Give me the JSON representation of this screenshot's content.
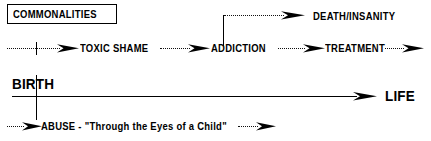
{
  "diagram": {
    "title_box": {
      "label": "COMMONALITIES"
    },
    "timeline": {
      "start_label": "BIRTH",
      "end_label": "LIFE"
    },
    "nodes": {
      "toxic_shame": "TOXIC SHAME",
      "addiction": "ADDICTION",
      "treatment": "TREATMENT",
      "death_insanity": "DEATH/INSANITY",
      "abuse": "ABUSE - \"Through the Eyes of a Child\""
    },
    "colors": {
      "ink": "#000000",
      "background": "#ffffff"
    }
  }
}
